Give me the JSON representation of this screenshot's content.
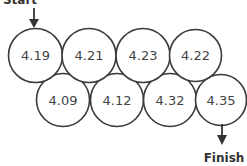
{
  "diagram": {
    "start_label": "Start",
    "finish_label": "Finish",
    "top_row": [
      {
        "value": "4.19"
      },
      {
        "value": "4.21"
      },
      {
        "value": "4.23"
      },
      {
        "value": "4.22"
      }
    ],
    "bottom_row": [
      {
        "value": "4.09"
      },
      {
        "value": "4.12"
      },
      {
        "value": "4.32"
      },
      {
        "value": "4.35"
      }
    ],
    "colors": {
      "stroke": "#3a3a3a",
      "text": "#444444",
      "background": "#ffffff"
    }
  }
}
